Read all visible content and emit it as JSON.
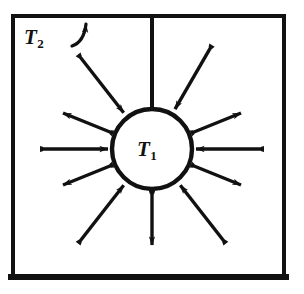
{
  "figure": {
    "type": "radiation-heat-transfer-diagram",
    "background_color": "#ffffff",
    "ink_color": "#111111"
  },
  "enclosure": {
    "name": "outer-square-enclosure",
    "label": "T",
    "label_subscript": "2",
    "left": 13,
    "top": 16,
    "right": 284,
    "bottom": 277,
    "stroke_width": 4,
    "bottom_stroke_width": 6
  },
  "sphere": {
    "name": "inner-sphere",
    "label": "T",
    "label_subscript": "1",
    "center_x": 152,
    "center_y": 149,
    "radius": 40,
    "stroke_width": 4
  },
  "leader": {
    "name": "t2-leader-arrow",
    "from_x": 72,
    "from_y": 46,
    "to_x": 88,
    "to_y": 20
  },
  "stem": {
    "name": "vertical-stem-line",
    "x": 152,
    "top_y": 18,
    "bottom_y": 109,
    "stroke_width": 4
  },
  "arrows": [
    {
      "name": "arrow-up-left-outward",
      "angle_deg": 202,
      "direction": "outward",
      "inner_r": 44,
      "outer_r": 96
    },
    {
      "name": "arrow-upper-left-inward",
      "angle_deg": 232,
      "direction": "inward",
      "inner_r": 46,
      "outer_r": 118
    },
    {
      "name": "arrow-upper-right-inward",
      "angle_deg": 300,
      "direction": "inward",
      "inner_r": 46,
      "outer_r": 118
    },
    {
      "name": "arrow-up-right-outward",
      "angle_deg": 338,
      "direction": "outward",
      "inner_r": 44,
      "outer_r": 96
    },
    {
      "name": "arrow-left-inward",
      "angle_deg": 180,
      "direction": "inward",
      "inner_r": 44,
      "outer_r": 110
    },
    {
      "name": "arrow-right-inward",
      "angle_deg": 0,
      "direction": "inward",
      "inner_r": 44,
      "outer_r": 110
    },
    {
      "name": "arrow-down-left-outward",
      "angle_deg": 158,
      "direction": "outward",
      "inner_r": 44,
      "outer_r": 96
    },
    {
      "name": "arrow-lower-left-inward",
      "angle_deg": 128,
      "direction": "inward",
      "inner_r": 46,
      "outer_r": 118
    },
    {
      "name": "arrow-bottom-outward",
      "angle_deg": 90,
      "direction": "outward",
      "inner_r": 44,
      "outer_r": 96
    },
    {
      "name": "arrow-lower-right-inward",
      "angle_deg": 52,
      "direction": "inward",
      "inner_r": 46,
      "outer_r": 118
    },
    {
      "name": "arrow-down-right-outward",
      "angle_deg": 22,
      "direction": "outward",
      "inner_r": 44,
      "outer_r": 96
    }
  ]
}
